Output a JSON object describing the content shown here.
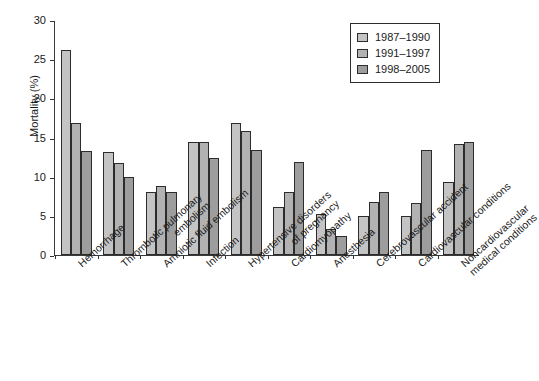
{
  "chart_data": {
    "type": "bar",
    "title": "",
    "subtitle": "",
    "xlabel": "",
    "ylabel": "Mortality (%)",
    "ylim": [
      0,
      30
    ],
    "yticks": [
      0,
      5,
      10,
      15,
      20,
      25,
      30
    ],
    "ytick_labels": [
      "0",
      "5",
      "10",
      "15",
      "20",
      "25",
      "30"
    ],
    "grid": false,
    "legend_position": "top-right",
    "categories": [
      "Hemorrhage",
      "Thrombotic pulmonary embolism",
      "Amniotic fluid embolism",
      "Infection",
      "Hypertensive disorders of pregnancy",
      "Cardiomyopathy",
      "Anesthesia",
      "Cerebrovascular accident",
      "Cardiovascular conditions",
      "Noncardiovascular medical conditions"
    ],
    "category_lines": [
      [
        "Hemorrhage"
      ],
      [
        "Thrombotic pulmonary",
        "embolism"
      ],
      [
        "Amniotic fluid embolism"
      ],
      [
        "Infection"
      ],
      [
        "Hypertensive disorders",
        "of pregnancy"
      ],
      [
        "Cardiomyopathy"
      ],
      [
        "Anesthesia"
      ],
      [
        "Cerebrovascular accident"
      ],
      [
        "Cardiovascular conditions"
      ],
      [
        "Noncardiovascular",
        "medical conditions"
      ]
    ],
    "series": [
      {
        "name": "1987–1990",
        "color": "#c4c4c4",
        "values": [
          26.2,
          13.2,
          8.0,
          14.4,
          16.8,
          6.1,
          5.2,
          5.0,
          5.0,
          9.3
        ]
      },
      {
        "name": "1991–1997",
        "color": "#b2b2b2",
        "values": [
          16.8,
          11.8,
          8.8,
          14.4,
          15.8,
          8.0,
          3.3,
          6.8,
          6.7,
          14.2
        ]
      },
      {
        "name": "1998–2005",
        "color": "#9d9d9d",
        "values": [
          13.3,
          9.9,
          8.0,
          12.4,
          13.4,
          11.9,
          2.4,
          8.1,
          13.4,
          14.4
        ]
      }
    ]
  },
  "legend": {
    "items": [
      {
        "label": "1987–1990",
        "swatch": "legend-swatch-1987-1990"
      },
      {
        "label": "1991–1997",
        "swatch": "legend-swatch-1991-1997"
      },
      {
        "label": "1998–2005",
        "swatch": "legend-swatch-1998-2005"
      }
    ]
  }
}
